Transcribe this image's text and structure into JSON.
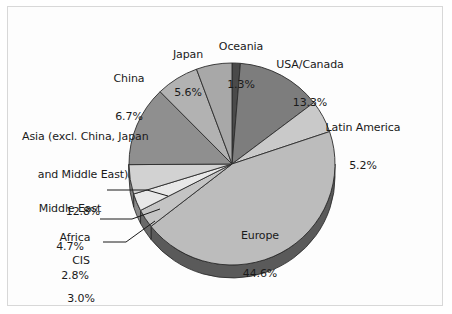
{
  "figure": {
    "background_color": "#ffffff",
    "frame_color": "#d8d8d8",
    "text_color": "#1a1a1a"
  },
  "chart_data": {
    "type": "pie",
    "title": "",
    "subtitle": "",
    "xlabel": "",
    "ylabel": "",
    "units": "percent",
    "total": 100.0,
    "start_angle_deg": 0,
    "direction": "clockwise",
    "three_d": true,
    "legend_position": "none",
    "labels_position": "outside-with-leader-lines",
    "grid": false,
    "categories": [
      "Oceania",
      "USA/Canada",
      "Latin America",
      "Europe",
      "CIS",
      "Africa",
      "Middle East",
      "Asia (excl. China, Japan and Middle East)",
      "China",
      "Japan"
    ],
    "values": [
      1.3,
      13.3,
      5.2,
      44.6,
      3.0,
      2.8,
      4.7,
      12.8,
      6.7,
      5.6
    ],
    "slices": [
      {
        "name": "Oceania",
        "value": 1.3,
        "value_label": "1.3%",
        "color": "#4a4a4a",
        "side_color": "#303030"
      },
      {
        "name": "USA/Canada",
        "value": 13.3,
        "value_label": "13.3%",
        "color": "#7d7d7d",
        "side_color": "#4f4f4f"
      },
      {
        "name": "Latin America",
        "value": 5.2,
        "value_label": "5.2%",
        "color": "#c9c9c9",
        "side_color": "#7d7d7d"
      },
      {
        "name": "Europe",
        "value": 44.6,
        "value_label": "44.6%",
        "color": "#bcbcbc",
        "side_color": "#5a5a5a"
      },
      {
        "name": "CIS",
        "value": 3.0,
        "value_label": "3.0%",
        "color": "#c4c4c4",
        "side_color": "#6a6a6a"
      },
      {
        "name": "Africa",
        "value": 2.8,
        "value_label": "2.8%",
        "color": "#e8e8e8",
        "side_color": "#8a8a8a"
      },
      {
        "name": "Middle East",
        "value": 4.7,
        "value_label": "4.7%",
        "color": "#d2d2d2",
        "side_color": "#808080"
      },
      {
        "name": "Asia (excl. China, Japan and Middle East)",
        "value": 12.8,
        "value_label": "12.8%",
        "color": "#8f8f8f",
        "side_color": "#5a5a5a"
      },
      {
        "name": "China",
        "value": 6.7,
        "value_label": "6.7%",
        "color": "#b2b2b2",
        "side_color": "#6d6d6d"
      },
      {
        "name": "Japan",
        "value": 5.6,
        "value_label": "5.6%",
        "color": "#a8a8a8",
        "side_color": "#6d6d6d"
      }
    ]
  },
  "labels": {
    "china": {
      "name": "China",
      "line1": "China",
      "line2": "6.7%"
    },
    "japan": {
      "name": "Japan",
      "line1": "Japan",
      "line2": "5.6%"
    },
    "oceania": {
      "name": "Oceania",
      "line1": "Oceania",
      "line2": "1.3%"
    },
    "usa_canada": {
      "name": "USA/Canada",
      "line1": "USA/Canada",
      "line2": "13.3%"
    },
    "latin": {
      "name": "Latin America",
      "line1": "Latin America",
      "line2": "5.2%"
    },
    "asia": {
      "name": "Asia",
      "line1": "Asia (excl. China, Japan",
      "line2": "and Middle East)",
      "line3": "12.8%"
    },
    "middle_east": {
      "name": "Middle East",
      "line1": "Middle East",
      "line2": "4.7%"
    },
    "africa": {
      "name": "Africa",
      "line1": "Africa",
      "line2": "2.8%"
    },
    "cis": {
      "name": "CIS",
      "line1": "CIS",
      "line2": "3.0%"
    },
    "europe": {
      "name": "Europe",
      "line1": "Europe",
      "line2": "44.6%"
    }
  }
}
